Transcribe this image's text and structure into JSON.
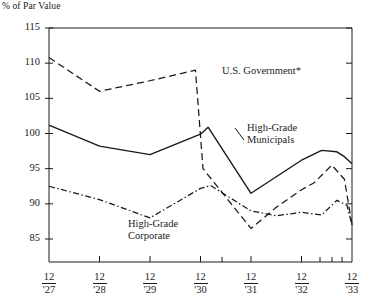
{
  "chart_data": {
    "type": "line",
    "title": "",
    "ylabel": "% of Par Value",
    "xlabel": "",
    "ylim": [
      83,
      115
    ],
    "yticks": [
      85,
      90,
      95,
      100,
      105,
      110,
      115
    ],
    "ytick_labels": [
      "85",
      "90",
      "95",
      "100",
      "105",
      "110",
      "115"
    ],
    "xlim": [
      1927.0,
      1933.0
    ],
    "xtick_labels": [
      {
        "num": "12",
        "yr": "'27"
      },
      {
        "num": "12",
        "yr": "'28"
      },
      {
        "num": "12",
        "yr": "'29"
      },
      {
        "num": "12",
        "yr": "'30"
      },
      {
        "num": "12",
        "yr": "'31"
      },
      {
        "num": "12",
        "yr": "'32"
      },
      {
        "num": "12",
        "yr": "'33"
      }
    ],
    "grid": false,
    "legend_position": "inline-annotations",
    "series": [
      {
        "name": "U.S. Government*",
        "style": "dashed",
        "color": "#1a1a1a",
        "x": [
          1927.0,
          1928.0,
          1929.0,
          1929.9,
          1930.05,
          1931.0,
          1931.5,
          1932.0,
          1932.25,
          1932.6,
          1932.85,
          1933.0
        ],
        "values": [
          110.8,
          106.0,
          107.5,
          109.0,
          95.0,
          86.5,
          89.5,
          92.0,
          93.0,
          95.5,
          93.5,
          87.0
        ]
      },
      {
        "name": "High-Grade Municipals",
        "style": "solid",
        "color": "#1a1a1a",
        "x": [
          1927.0,
          1928.0,
          1929.0,
          1930.0,
          1930.15,
          1931.0,
          1932.0,
          1932.4,
          1932.7,
          1932.85,
          1933.0
        ],
        "values": [
          101.2,
          98.2,
          97.0,
          99.9,
          100.9,
          91.5,
          96.2,
          97.6,
          97.4,
          96.7,
          95.7
        ]
      },
      {
        "name": "High-Grade Corporate",
        "style": "dashdot",
        "color": "#1a1a1a",
        "x": [
          1927.0,
          1928.0,
          1929.0,
          1930.0,
          1930.2,
          1931.0,
          1931.5,
          1932.0,
          1932.4,
          1932.7,
          1932.9,
          1933.0
        ],
        "values": [
          92.5,
          90.6,
          88.0,
          92.2,
          92.6,
          89.0,
          88.3,
          88.8,
          88.4,
          90.5,
          89.8,
          87.0
        ]
      }
    ],
    "annotations": [
      {
        "text": "U.S. Government*",
        "x_px": 222,
        "y_px": 65
      },
      {
        "text": "High-Grade",
        "x_px": 247,
        "y_px": 122
      },
      {
        "text": "Municipals",
        "x_px": 247,
        "y_px": 134
      },
      {
        "text": "High-Grade",
        "x_px": 128,
        "y_px": 218
      },
      {
        "text": "Corporate",
        "x_px": 128,
        "y_px": 230
      }
    ]
  }
}
